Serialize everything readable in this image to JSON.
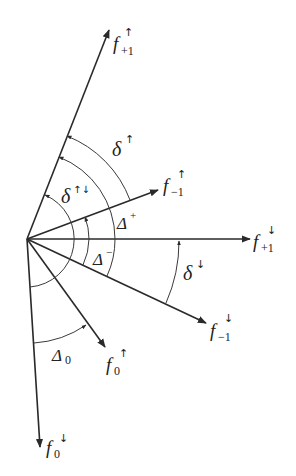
{
  "diagram": {
    "origin": [
      27,
      239
    ],
    "vectors": [
      {
        "id": "f_up_plus1",
        "base": "f",
        "sub": "+1",
        "spin": "↑",
        "tip": [
          109,
          30
        ],
        "label_pos": [
          113,
          50
        ]
      },
      {
        "id": "f_up_minus1",
        "base": "f",
        "sub": "−1",
        "spin": "↑",
        "tip": [
          158,
          190
        ],
        "label_pos": [
          163,
          192
        ]
      },
      {
        "id": "f_down_plus1",
        "base": "f",
        "sub": "+1",
        "spin": "↓",
        "tip": [
          250,
          239
        ],
        "label_pos": [
          253,
          248
        ]
      },
      {
        "id": "f_down_minus1",
        "base": "f",
        "sub": "−1",
        "spin": "↓",
        "tip": [
          206,
          323
        ],
        "label_pos": [
          210,
          337
        ]
      },
      {
        "id": "f_up_0",
        "base": "f",
        "sub": "0",
        "spin": "↑",
        "tip": [
          105,
          347
        ],
        "label_pos": [
          106,
          371
        ]
      },
      {
        "id": "f_down_0",
        "base": "f",
        "sub": "0",
        "spin": "↓",
        "tip": [
          40,
          447
        ],
        "label_pos": [
          46,
          454
        ]
      }
    ],
    "angles": [
      {
        "id": "delta_up",
        "symbol": "δ",
        "sup": "↑",
        "label_pos": [
          112,
          156
        ]
      },
      {
        "id": "delta_updown",
        "symbol": "δ",
        "sup": "↑↓",
        "label_pos": [
          61,
          203
        ]
      },
      {
        "id": "Delta_plus",
        "symbol": "Δ",
        "sup": "+",
        "label_pos": [
          117,
          229
        ]
      },
      {
        "id": "Delta_minus",
        "symbol": "Δ",
        "sup": "−",
        "label_pos": [
          92,
          265
        ]
      },
      {
        "id": "delta_down",
        "symbol": "δ",
        "sup": "↓",
        "label_pos": [
          183,
          280
        ]
      },
      {
        "id": "Delta_0",
        "symbol": "Δ",
        "sub": "0",
        "label_pos": [
          52,
          361
        ]
      }
    ]
  }
}
